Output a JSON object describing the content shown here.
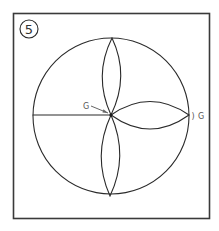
{
  "figure": {
    "step_number": "5",
    "labels": {
      "center_label": "G",
      "right_label": "G",
      "right_mark": ")"
    },
    "colors": {
      "stroke": "#2a2a2a",
      "frame": "#3a3a3a",
      "label": "#555555",
      "background": "#ffffff"
    }
  }
}
